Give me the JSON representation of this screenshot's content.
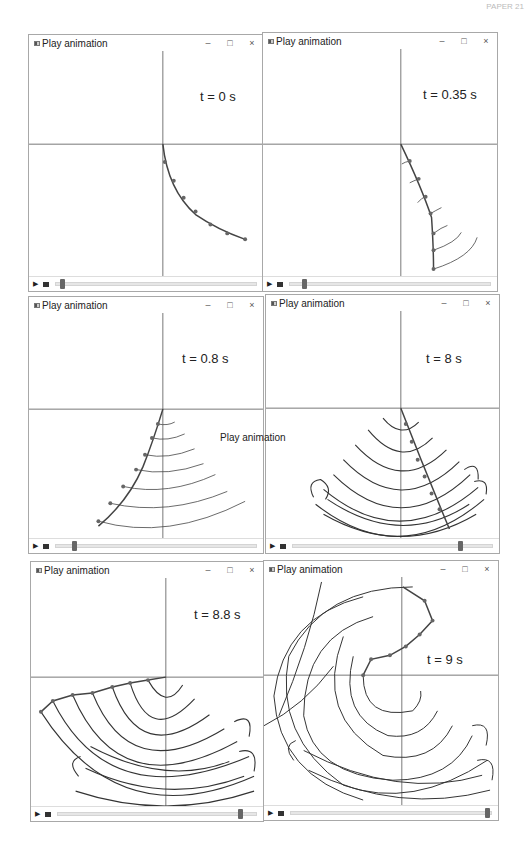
{
  "header_fragment": "PAPER 21",
  "windows": [
    {
      "id": "w1",
      "title": "Play animation",
      "time_label": "t = 0 s",
      "slider_pct": 2,
      "buttons": {
        "minimize": "–",
        "maximize": "□",
        "close": "×"
      }
    },
    {
      "id": "w2",
      "title": "Play animation",
      "time_label": "t = 0.35 s",
      "slider_pct": 6,
      "buttons": {
        "minimize": "–",
        "maximize": "□",
        "close": "×"
      }
    },
    {
      "id": "w3",
      "title": "Play animation",
      "time_label": "t = 0.8 s",
      "slider_pct": 8,
      "buttons": {
        "minimize": "–",
        "maximize": "□",
        "close": "×"
      }
    },
    {
      "id": "w4",
      "title": "Play animation",
      "time_label": "t = 8 s",
      "slider_pct": 83,
      "buttons": {
        "minimize": "–",
        "maximize": "□",
        "close": "×"
      }
    },
    {
      "id": "w5",
      "title": "Play animation",
      "time_label": "t = 8.8 s",
      "slider_pct": 91,
      "buttons": {
        "minimize": "–",
        "maximize": "□",
        "close": "×"
      }
    },
    {
      "id": "w6",
      "title": "Play animation",
      "time_label": "t = 9 s",
      "slider_pct": 99,
      "buttons": {
        "minimize": "–",
        "maximize": "□",
        "close": "×"
      }
    }
  ],
  "floating_tooltip": "Play animation",
  "controls": {
    "play_icon": "▶",
    "folder_icon": "folder"
  },
  "footer_caption": "...animations of a pendulum chain..."
}
